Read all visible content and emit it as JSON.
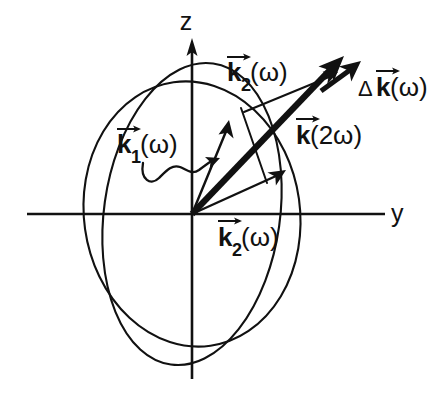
{
  "figure": {
    "background_color": "#ffffff",
    "ink_color": "#111111"
  },
  "axes": {
    "vertical": {
      "label": "z",
      "name": "z-axis"
    },
    "horizontal": {
      "label": "y",
      "name": "y-axis"
    },
    "origin": {
      "x": 192,
      "y": 214
    }
  },
  "labels": {
    "k1_omega": {
      "symbol": "k",
      "subscript": "1",
      "argument": "(ω)",
      "full": "k⃗1(ω)",
      "x": 118,
      "y": 150
    },
    "k2_omega_top": {
      "symbol": "k",
      "subscript": "2",
      "argument": "(ω)",
      "full": "k⃗2(ω)",
      "x": 228,
      "y": 78
    },
    "k2_omega_bottom": {
      "symbol": "k",
      "subscript": "2",
      "argument": "(ω)",
      "full": "k⃗2(ω)",
      "x": 219,
      "y": 245
    },
    "k_2omega": {
      "symbol": "k",
      "subscript": "",
      "argument": "(2ω)",
      "full": "k⃗(2ω)",
      "x": 296,
      "y": 143
    },
    "delta_k_omega": {
      "delta": "Δ",
      "symbol": "k",
      "argument": "(ω)",
      "full": "Δk⃗(ω)",
      "x": 362,
      "y": 92
    }
  },
  "surfaces": [
    {
      "name": "ordinary-index-ellipse",
      "shape": "ellipse",
      "cx": 192,
      "cy": 214,
      "rx": 108,
      "ry": 133,
      "rotation_deg": -8
    },
    {
      "name": "extraordinary-index-ellipse",
      "shape": "ellipse",
      "cx": 192,
      "cy": 214,
      "rx": 88,
      "ry": 152,
      "rotation_deg": 8
    }
  ],
  "vectors": [
    {
      "name": "k2-omega-upper",
      "style": "thin",
      "from": {
        "x": 192,
        "y": 214
      },
      "to": {
        "x": 229,
        "y": 124
      }
    },
    {
      "name": "k-2omega-bold",
      "style": "bold",
      "from": {
        "x": 192,
        "y": 214
      },
      "to": {
        "x": 342,
        "y": 58
      }
    },
    {
      "name": "k2-omega-lower",
      "style": "thin",
      "from": {
        "x": 192,
        "y": 214
      },
      "to": {
        "x": 284,
        "y": 172
      }
    },
    {
      "name": "k2-omega-leader-arrow",
      "style": "thin",
      "from": {
        "x": 246,
        "y": 122
      },
      "to": {
        "x": 337,
        "y": 72
      }
    },
    {
      "name": "delta-k-omega",
      "style": "delta",
      "from": {
        "x": 323,
        "y": 89
      },
      "to": {
        "x": 359,
        "y": 63
      }
    },
    {
      "name": "k1-omega-wiggly-pointer",
      "style": "wiggle",
      "from": {
        "x": 146,
        "y": 178
      },
      "to": {
        "x": 214,
        "y": 161
      }
    }
  ]
}
